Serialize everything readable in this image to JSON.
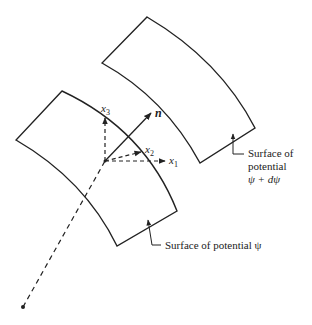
{
  "diagram": {
    "type": "potential-surfaces",
    "surfaces": [
      {
        "id": "surface-psi",
        "label": "Surface of potential ψ"
      },
      {
        "id": "surface-psi-dpsi",
        "label_lines": [
          "Surface of",
          "potential",
          "ψ + dψ"
        ]
      }
    ],
    "axes": {
      "x1": "x",
      "x1_sub": "1",
      "x2": "x",
      "x2_sub": "2",
      "x3": "x",
      "x3_sub": "3",
      "normal": "n"
    },
    "colors": {
      "stroke": "#222222",
      "background": "#ffffff"
    }
  }
}
